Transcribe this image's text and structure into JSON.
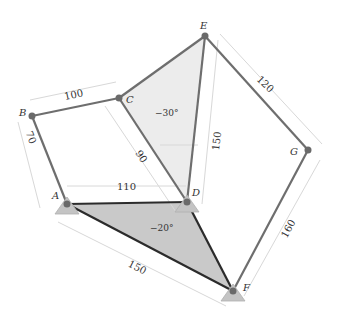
{
  "figure": {
    "nodes": {
      "A": {
        "label": "A",
        "x": 67,
        "y": 204
      },
      "B": {
        "label": "B",
        "x": 32,
        "y": 116
      },
      "C": {
        "label": "C",
        "x": 119,
        "y": 98
      },
      "D": {
        "label": "D",
        "x": 187,
        "y": 202
      },
      "E": {
        "label": "E",
        "x": 205,
        "y": 36
      },
      "F": {
        "label": "F",
        "x": 233,
        "y": 291
      },
      "G": {
        "label": "G",
        "x": 308,
        "y": 150
      }
    },
    "dimensions": {
      "AB": "70",
      "BC": "100",
      "CD": "90",
      "AD": "110",
      "DE": "150",
      "EG": "120",
      "GF": "160",
      "AF": "150"
    },
    "angles": {
      "CDE": "−30°",
      "ADF": "−20°"
    },
    "colors": {
      "link": "#6e6e6e",
      "ground_link": "#2b2b2b",
      "fill_upper": "#ececec",
      "fill_lower": "#c9c9c9",
      "support": "#c4c4c4",
      "joint": "#6a6a6a",
      "dim_line": "#d6d6d6"
    }
  }
}
